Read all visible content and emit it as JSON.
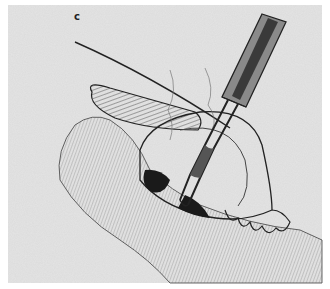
{
  "figure": {
    "panel_label": "c",
    "colors": {
      "paper": "#e4e4e4",
      "ink": "#222222",
      "shadow": "#1a1a1a"
    }
  }
}
